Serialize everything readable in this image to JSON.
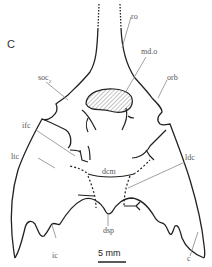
{
  "figure": {
    "panel_label": "C",
    "labels": {
      "ro": "ro",
      "md_o": "md.o",
      "soc": "soc",
      "soc_sub": "2",
      "orb": "orb",
      "ifc": "ifc",
      "ltc": "ltc",
      "ldc": "ldc",
      "dcm": "dcm",
      "dsp": "dsp",
      "ic": "ic",
      "c": "c"
    },
    "scale_bar": {
      "label": "5 mm"
    },
    "colors": {
      "outline": "#222222",
      "leader": "#888888",
      "hatch": "#999999"
    }
  }
}
